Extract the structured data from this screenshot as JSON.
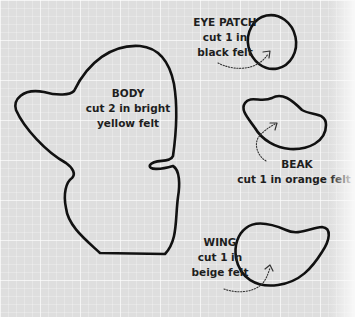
{
  "pattern": {
    "pieces": [
      {
        "id": "body",
        "title": "BODY",
        "lines": [
          "cut 2 in bright",
          "yellow felt"
        ]
      },
      {
        "id": "eye_patch",
        "title": "EYE PATCH",
        "lines": [
          "cut 1 in",
          "black felt"
        ]
      },
      {
        "id": "beak",
        "title": "BEAK",
        "lines": [
          "cut 1 in orange felt"
        ]
      },
      {
        "id": "wing",
        "title": "WING",
        "lines": [
          "cut 1 in",
          "beige felt"
        ]
      }
    ]
  },
  "colors": {
    "background": "#dedede",
    "outline": "#111111",
    "text": "#1e1e1e"
  }
}
